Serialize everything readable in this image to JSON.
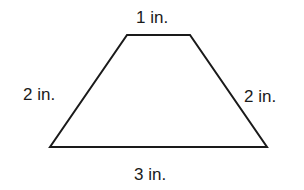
{
  "diagram": {
    "shape": "trapezoid",
    "stroke_color": "#1a1a1a",
    "vertices": [
      [
        127,
        35
      ],
      [
        190,
        35
      ],
      [
        267,
        147
      ],
      [
        50,
        147
      ]
    ],
    "labels": {
      "top": "1 in.",
      "left": "2 in.",
      "right": "2 in.",
      "bottom": "3 in."
    }
  }
}
